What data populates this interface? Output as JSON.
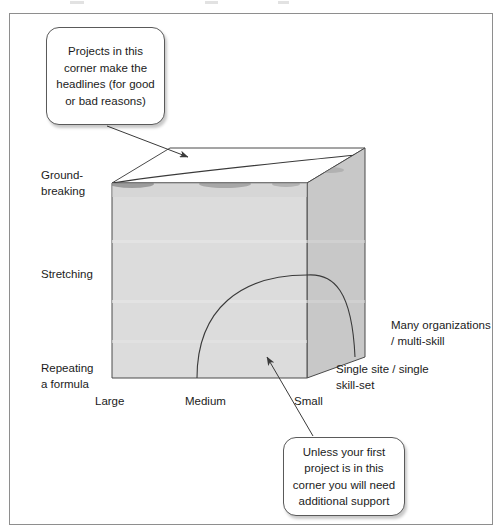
{
  "figure": {
    "background_color": "#ffffff",
    "frame_border_color": "#8e8e8e"
  },
  "cube": {
    "front_face_color": "#dcdcdc",
    "right_face_color": "#c8c8c8",
    "top_face_color": "#ffffff",
    "edge_color": "#4a4a4a",
    "arc_color": "#3a3a3a",
    "front_top_left": "112,183",
    "front_top_right": "307,183",
    "front_bottom_left": "112,378",
    "front_bottom_right": "307,378",
    "back_top_left": "170,148",
    "back_top_right": "365,148",
    "back_bottom_right": "365,357"
  },
  "callouts": {
    "top": {
      "text": "Projects in this\ncorner make the\nheadlines (for good\nor bad reasons)",
      "pointer_from": "107,126",
      "pointer_to": "188,157"
    },
    "bottom": {
      "text": "Unless your first\nproject is in this\ncorner you will need\nadditional support",
      "pointer_from": "313,436",
      "pointer_to": "267,357"
    }
  },
  "axes": {
    "vertical_label_top": "Ground-\nbreaking",
    "vertical_label_middle": "Stretching",
    "vertical_label_bottom": "Repeating\na formula",
    "horizontal_label_left": "Large",
    "horizontal_label_middle": "Medium",
    "horizontal_label_right": "Small",
    "depth_label_far": "Many organizations\n/ multi-skill",
    "depth_label_near": "Single site / single\nskill-set"
  }
}
